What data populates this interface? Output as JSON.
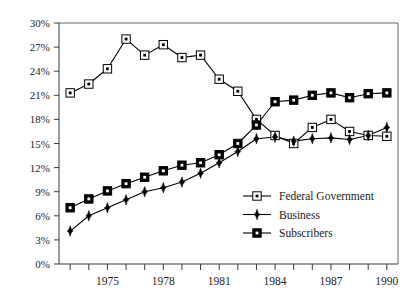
{
  "chart_data": {
    "type": "line",
    "title": "",
    "subtitle": "",
    "xlabel": "",
    "ylabel": "",
    "xlim": [
      1972.4,
      1990.6
    ],
    "ylim": [
      0,
      30
    ],
    "ytick_values": [
      0,
      3,
      6,
      9,
      12,
      15,
      18,
      21,
      24,
      27,
      30
    ],
    "ytick_labels": [
      "0%",
      "3%",
      "6%",
      "9%",
      "12%",
      "15%",
      "18%",
      "21%",
      "24%",
      "27%",
      "30%"
    ],
    "xtick_values": [
      1973,
      1974,
      1975,
      1976,
      1977,
      1978,
      1979,
      1980,
      1981,
      1982,
      1983,
      1984,
      1985,
      1986,
      1987,
      1988,
      1989,
      1990
    ],
    "xtick_labeled": [
      1975,
      1978,
      1981,
      1984,
      1987,
      1990
    ],
    "xtick_labels": [
      "1975",
      "1978",
      "1981",
      "1984",
      "1987",
      "1990"
    ],
    "grid": false,
    "legend_position": "center-bottom-right",
    "x": [
      1973,
      1974,
      1975,
      1976,
      1977,
      1978,
      1979,
      1980,
      1981,
      1982,
      1983,
      1984,
      1985,
      1986,
      1987,
      1988,
      1989,
      1990
    ],
    "series": [
      {
        "name": "Federal Government",
        "marker": "open-square-with-dot",
        "color": "#000000",
        "values": [
          21.3,
          22.4,
          24.3,
          28.0,
          26.0,
          27.3,
          25.7,
          26.0,
          23.0,
          21.5,
          18.0,
          16.0,
          15.0,
          17.0,
          18.0,
          16.5,
          16.0,
          15.9
        ]
      },
      {
        "name": "Business",
        "marker": "filled-diamond",
        "color": "#000000",
        "values": [
          4.1,
          6.0,
          7.0,
          8.0,
          9.0,
          9.5,
          10.2,
          11.3,
          12.6,
          14.0,
          15.6,
          15.8,
          15.3,
          15.6,
          15.7,
          15.5,
          16.0,
          17.0
        ]
      },
      {
        "name": "Subscribers",
        "marker": "filled-square-with-white-dot",
        "color": "#000000",
        "values": [
          7.0,
          8.1,
          9.1,
          10.0,
          10.8,
          11.6,
          12.3,
          12.6,
          13.6,
          15.0,
          17.3,
          20.2,
          20.4,
          21.0,
          21.3,
          20.7,
          21.2,
          21.3
        ]
      }
    ]
  },
  "legend": {
    "entries": [
      {
        "label": "Federal Government",
        "marker": "open-square-with-dot"
      },
      {
        "label": "Business",
        "marker": "filled-diamond"
      },
      {
        "label": "Subscribers",
        "marker": "filled-square-with-white-dot"
      }
    ]
  }
}
